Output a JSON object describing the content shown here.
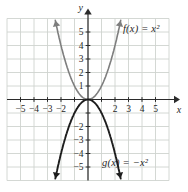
{
  "figure": {
    "background": "#ffffff",
    "width": 188,
    "height": 192
  },
  "chart_data": {
    "type": "line",
    "title": "",
    "xlabel": "x",
    "ylabel": "y",
    "xlim": [
      -6,
      6
    ],
    "ylim": [
      -6,
      6
    ],
    "grid": true,
    "legend_position": "none",
    "tick_positions": [
      -5,
      -4,
      -3,
      -2,
      -1,
      1,
      2,
      3,
      4,
      5
    ],
    "x_tick_labels": [
      -5,
      -4,
      -3,
      -2,
      2,
      3,
      4,
      5
    ],
    "y_tick_labels": [
      5,
      4,
      3,
      2,
      1,
      -2,
      -3,
      -4,
      -5
    ],
    "series": [
      {
        "name": "f",
        "label": "f(x) = x²",
        "equation": "y = x^2",
        "coefficient": 1,
        "vertex": [
          0,
          0
        ],
        "domain": [
          -2.42,
          2.42
        ],
        "sample_points": [
          [
            -2,
            4
          ],
          [
            -1,
            1
          ],
          [
            0,
            0
          ],
          [
            1,
            1
          ],
          [
            2,
            4
          ]
        ],
        "color": "#7e7e7e",
        "stroke_width": 1.6
      },
      {
        "name": "g",
        "label": "g(x) = −x²",
        "equation": "y = -x^2",
        "coefficient": -1,
        "vertex": [
          0,
          0
        ],
        "domain": [
          -2.42,
          2.42
        ],
        "sample_points": [
          [
            -2,
            -4
          ],
          [
            -1,
            -1
          ],
          [
            0,
            0
          ],
          [
            1,
            -1
          ],
          [
            2,
            -4
          ]
        ],
        "color": "#1d1d1d",
        "stroke_width": 1.9
      }
    ],
    "colors": {
      "grid": "#cfd4cf",
      "axis": "#2b2b2b",
      "text": "#1f1f1f"
    }
  }
}
